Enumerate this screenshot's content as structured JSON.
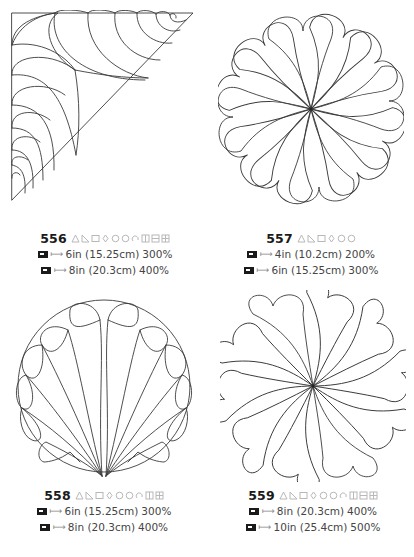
{
  "patterns": [
    {
      "id": "556",
      "shape": "triangle-corner-feathers",
      "symbols": [
        "triangle",
        "triangle-half",
        "square",
        "diamond",
        "circle",
        "circle",
        "rotate",
        "grid",
        "grid",
        "grid"
      ],
      "sizes": [
        {
          "machine_icon": "sewing-machine-icon",
          "size": "6in (15.25cm)",
          "scale": "300%"
        },
        {
          "machine_icon": "sewing-machine-icon",
          "size": "8in (20.3cm)",
          "scale": "400%"
        }
      ]
    },
    {
      "id": "557",
      "shape": "round-swirl-feathers",
      "symbols": [
        "triangle",
        "triangle-half",
        "square",
        "diamond",
        "circle",
        "circle"
      ],
      "sizes": [
        {
          "machine_icon": "sewing-machine-icon",
          "size": "4in (10.2cm)",
          "scale": "200%"
        },
        {
          "machine_icon": "sewing-machine-icon",
          "size": "6in (15.25cm)",
          "scale": "300%"
        }
      ]
    },
    {
      "id": "558",
      "shape": "circle-fan-feathers",
      "symbols": [
        "triangle",
        "triangle-half",
        "square",
        "diamond",
        "circle",
        "circle",
        "rotate",
        "grid",
        "grid"
      ],
      "sizes": [
        {
          "machine_icon": "sewing-machine-icon",
          "size": "6in (15.25cm)",
          "scale": "300%"
        },
        {
          "machine_icon": "sewing-machine-icon",
          "size": "8in (20.3cm)",
          "scale": "400%"
        }
      ]
    },
    {
      "id": "559",
      "shape": "square-swirl-feathers",
      "symbols": [
        "triangle",
        "triangle-half",
        "square",
        "diamond",
        "circle",
        "circle",
        "rotate",
        "grid",
        "grid",
        "grid"
      ],
      "sizes": [
        {
          "machine_icon": "sewing-machine-icon",
          "size": "8in (20.3cm)",
          "scale": "400%"
        },
        {
          "machine_icon": "sewing-machine-icon",
          "size": "10in (25.4cm)",
          "scale": "500%"
        }
      ]
    }
  ],
  "size_arrow": "⟼"
}
